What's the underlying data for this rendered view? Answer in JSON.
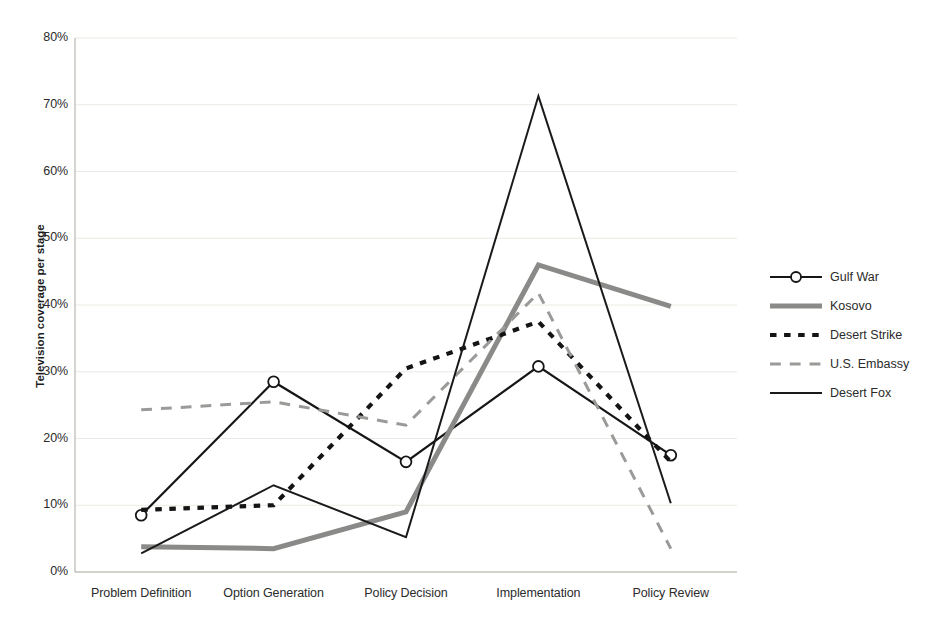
{
  "chart_data": {
    "type": "line",
    "title": "",
    "xlabel": "",
    "ylabel": "Television coverage per stage",
    "ylim": [
      0,
      80
    ],
    "ytick_labels": [
      "0%",
      "10%",
      "20%",
      "30%",
      "40%",
      "50%",
      "60%",
      "70%",
      "80%"
    ],
    "ytick_values": [
      0,
      10,
      20,
      30,
      40,
      50,
      60,
      70,
      80
    ],
    "grid": true,
    "legend_position": "right",
    "categories": [
      "Problem Definition",
      "Option Generation",
      "Policy Decision",
      "Implementation",
      "Policy Review"
    ],
    "series": [
      {
        "name": "Gulf War",
        "style": "solid-marker",
        "color": "#161616",
        "marker": "circle",
        "width": 2.2,
        "values": [
          8.5,
          28.5,
          16.5,
          30.8,
          17.5
        ]
      },
      {
        "name": "Kosovo",
        "style": "solid-thick",
        "color": "#8a8a88",
        "marker": "none",
        "width": 5.0,
        "values": [
          3.8,
          3.5,
          9.0,
          46.0,
          39.8
        ]
      },
      {
        "name": "Desert Strike",
        "style": "dashed-bold",
        "color": "#141414",
        "marker": "none",
        "width": 4.2,
        "values": [
          9.3,
          10.0,
          30.5,
          37.5,
          16.5
        ]
      },
      {
        "name": "U.S. Embassy",
        "style": "dashed",
        "color": "#9a9a98",
        "marker": "none",
        "width": 3.0,
        "values": [
          24.3,
          25.5,
          22.0,
          41.8,
          3.5
        ]
      },
      {
        "name": "Desert Fox",
        "style": "solid-thin",
        "color": "#1a1a1a",
        "marker": "none",
        "width": 2.0,
        "values": [
          2.8,
          13.0,
          5.2,
          71.3,
          10.3
        ]
      }
    ]
  },
  "legend": {
    "items": [
      {
        "label": "Gulf War"
      },
      {
        "label": "Kosovo"
      },
      {
        "label": "Desert Strike"
      },
      {
        "label": "U.S. Embassy"
      },
      {
        "label": "Desert Fox"
      }
    ]
  },
  "caption": {
    "text": ""
  }
}
